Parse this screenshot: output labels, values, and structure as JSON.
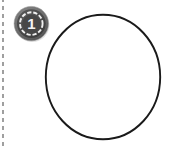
{
  "canvas": {
    "width": 173,
    "height": 147,
    "background_color": "#ffffff"
  },
  "badge": {
    "name": "rank-badge",
    "number": "1",
    "icon_name": "medal-rank-one-icon",
    "body_color": "#4a4a4a",
    "rim_color": "#6e6e6e",
    "ring_color": "#f0f0f0",
    "number_color": "#f2f2f2",
    "shadow_color": "#bfbfbf",
    "segments": 12
  },
  "shapes": {
    "main_circle": {
      "name": "main-circle-shape",
      "stroke_color": "#1a1a1a",
      "fill_color": "#ffffff",
      "stroke_width": 2,
      "left": 44,
      "top": 13,
      "width": 118,
      "height": 128
    },
    "edge_dashed_line": {
      "name": "edge-dashed-line",
      "color": "#8e8e8e",
      "left": 2,
      "width": 2,
      "dash_length": 4,
      "gap_length": 4
    }
  }
}
